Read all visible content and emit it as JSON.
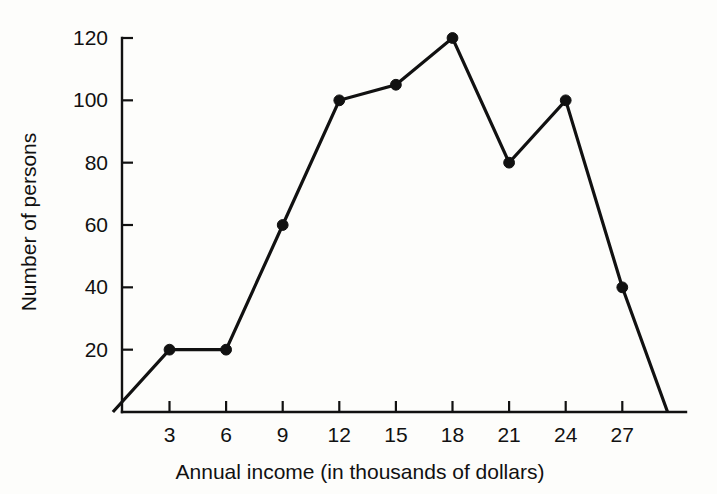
{
  "chart_data": {
    "type": "line",
    "title": "",
    "subtitle": "",
    "xlabel": "Annual income (in thousands of dollars)",
    "ylabel": "Number of persons",
    "x": [
      0,
      3,
      6,
      9,
      12,
      15,
      18,
      21,
      24,
      27,
      29.4
    ],
    "values": [
      0,
      20,
      20,
      60,
      100,
      105,
      120,
      80,
      100,
      40,
      0
    ],
    "series": [
      {
        "name": "Number of persons",
        "x": [
          0,
          3,
          6,
          9,
          12,
          15,
          18,
          21,
          24,
          27,
          29.4
        ],
        "values": [
          0,
          20,
          20,
          60,
          100,
          105,
          120,
          80,
          100,
          40,
          0
        ]
      }
    ],
    "marked_points": [
      {
        "x": 3,
        "y": 20
      },
      {
        "x": 6,
        "y": 20
      },
      {
        "x": 9,
        "y": 60
      },
      {
        "x": 12,
        "y": 100
      },
      {
        "x": 15,
        "y": 105
      },
      {
        "x": 18,
        "y": 120
      },
      {
        "x": 21,
        "y": 80
      },
      {
        "x": 24,
        "y": 100
      },
      {
        "x": 27,
        "y": 40
      }
    ],
    "xticks": [
      3,
      6,
      9,
      12,
      15,
      18,
      21,
      24,
      27
    ],
    "xtick_labels": [
      "3",
      "6",
      "9",
      "12",
      "15",
      "18",
      "21",
      "24",
      "27"
    ],
    "yticks": [
      20,
      40,
      60,
      80,
      100,
      120
    ],
    "ytick_labels": [
      "20",
      "40",
      "60",
      "80",
      "100",
      "120"
    ],
    "xlim": [
      0,
      30
    ],
    "ylim": [
      0,
      126
    ],
    "grid": false,
    "legend": false,
    "legend_position": "none",
    "line_color": "#111111",
    "marker_color": "#111111",
    "background_color": "#fdfdfb"
  }
}
